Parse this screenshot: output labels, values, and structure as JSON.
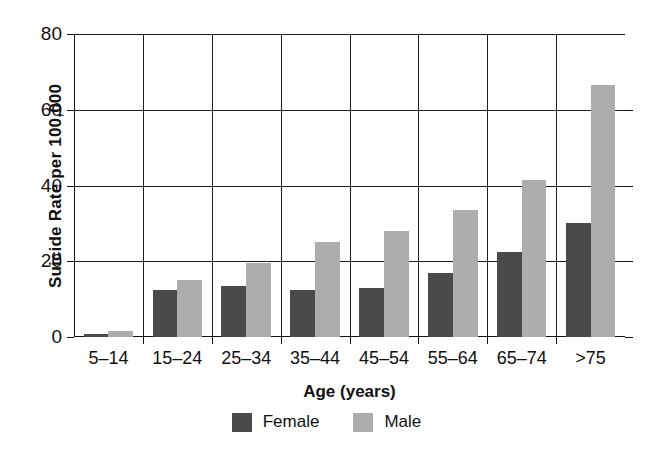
{
  "chart_data": {
    "type": "bar",
    "title": "",
    "xlabel": "Age (years)",
    "ylabel": "Suicide Rate per 100,000",
    "categories": [
      "5–14",
      "15–24",
      "25–34",
      "35–44",
      "45–54",
      "55–64",
      "65–74",
      ">75"
    ],
    "series": [
      {
        "name": "Female",
        "color": "#4a4a4a",
        "values": [
          0.8,
          12.5,
          13.5,
          12.3,
          13.0,
          16.8,
          22.5,
          30.0
        ]
      },
      {
        "name": "Male",
        "color": "#adadad",
        "values": [
          1.5,
          15.0,
          19.5,
          25.2,
          28.0,
          33.5,
          41.5,
          66.5
        ]
      }
    ],
    "ylim": [
      0,
      80
    ],
    "yticks": [
      0,
      20,
      40,
      60,
      80
    ],
    "ytick_labels": [
      "0",
      "20",
      "40",
      "60",
      "80"
    ],
    "grid": "both",
    "legend_position": "bottom-center"
  },
  "legend": {
    "entries": [
      {
        "label": "Female",
        "color": "#4a4a4a"
      },
      {
        "label": "Male",
        "color": "#adadad"
      }
    ]
  },
  "colors": {
    "female": "#4a4a4a",
    "male": "#adadad",
    "axis": "#111111",
    "grid": "#1c1c1c",
    "background": "#ffffff"
  }
}
